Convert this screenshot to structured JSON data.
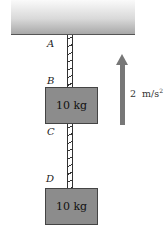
{
  "diagram": {
    "points": {
      "A": "A",
      "B": "B",
      "C": "C",
      "D": "D"
    },
    "blocks": [
      {
        "label": "10 kg"
      },
      {
        "label": "10 kg"
      }
    ],
    "acceleration": {
      "value": "2",
      "unit": "m/s",
      "exponent": "2",
      "direction": "up"
    },
    "colors": {
      "block": "#8c8c8c",
      "arrow": "#777777",
      "ceiling": "#c8c8c8"
    }
  }
}
